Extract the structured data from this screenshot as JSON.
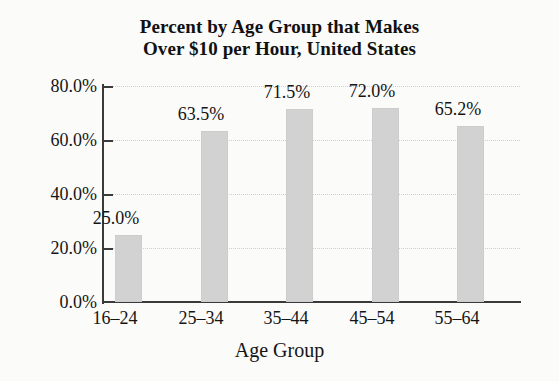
{
  "chart_data": {
    "type": "bar",
    "title": "Percent by Age Group that Makes Over $10 per Hour, United States",
    "title_lines": [
      "Percent by Age Group that Makes",
      "Over $10 per Hour, United States"
    ],
    "categories": [
      "16–24",
      "25–34",
      "35–44",
      "45–54",
      "55–64"
    ],
    "values": [
      25.0,
      63.5,
      71.5,
      72.0,
      65.2
    ],
    "value_labels": [
      "25.0%",
      "63.5%",
      "71.5%",
      "72.0%",
      "65.2%"
    ],
    "xlabel": "Age Group",
    "ylabel": "",
    "ylim": [
      0,
      80
    ],
    "ytick_values": [
      0,
      20,
      40,
      60,
      80
    ],
    "ytick_labels": [
      "0.0%",
      "20.0%",
      "40.0%",
      "60.0%",
      "80.0%"
    ],
    "grid": true,
    "legend": false,
    "bar_color": "#d2d2d2",
    "axis_color": "#3a3a3a",
    "gridline_color": "#cfcfcf",
    "background_color": "#fbfbfa"
  }
}
